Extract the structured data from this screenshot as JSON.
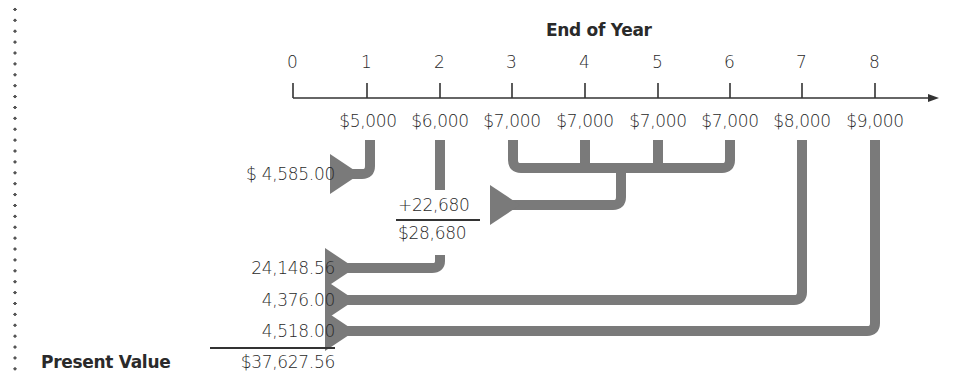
{
  "title": "End of Year",
  "timeline": {
    "years": [
      "0",
      "1",
      "2",
      "3",
      "4",
      "5",
      "6",
      "7",
      "8"
    ],
    "cash_flows": [
      "$5,000",
      "$6,000",
      "$7,000",
      "$7,000",
      "$7,000",
      "$7,000",
      "$8,000",
      "$9,000"
    ]
  },
  "calculations": {
    "pv_year1": "$ 4,585.00",
    "annuity_pv": "+22,680",
    "year2_total": "$28,680",
    "pv_year2_total": "24,148.56",
    "pv_year7": "4,376.00",
    "pv_year8": "4,518.00",
    "present_value_label": "Present Value",
    "present_value": "$37,627.56"
  },
  "colors": {
    "arrow": "#7a7a7a",
    "text": "#2a2a2a",
    "axis": "#333333"
  }
}
